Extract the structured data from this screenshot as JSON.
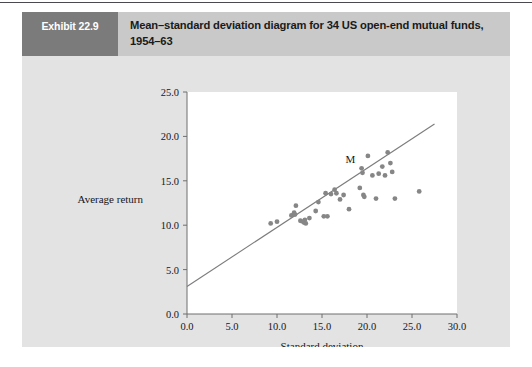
{
  "exhibit": {
    "tag": "Exhibit 22.9",
    "title": "Mean–standard deviation diagram for 34 US open-end mutual funds, 1954–63"
  },
  "colors": {
    "card_background": "#e3e3e3",
    "header_background": "#c9c9c9",
    "tag_background": "#7b7b7b",
    "plot_background": "#ffffff",
    "point": "#868686",
    "line": "#7c7c7c",
    "axis": "#6f6f6f"
  },
  "chart_data": {
    "type": "scatter",
    "title": "Mean–standard deviation diagram for 34 US open-end mutual funds, 1954–63",
    "xlabel": "Standard deviation",
    "ylabel": "Average return",
    "xlim": [
      0.0,
      30.0
    ],
    "ylim": [
      0.0,
      25.0
    ],
    "xticks": [
      "0.0",
      "5.0",
      "10.0",
      "15.0",
      "20.0",
      "25.0",
      "30.0"
    ],
    "yticks": [
      "0.0",
      "5.0",
      "10.0",
      "15.0",
      "20.0",
      "25.0"
    ],
    "xtick_values": [
      0,
      5,
      10,
      15,
      20,
      25,
      30
    ],
    "ytick_values": [
      0,
      5,
      10,
      15,
      20,
      25
    ],
    "grid": false,
    "legend": "none",
    "series": [
      {
        "name": "US open-end mutual funds",
        "marker": "filled-circle",
        "points": [
          [
            9.3,
            10.2
          ],
          [
            10.0,
            10.4
          ],
          [
            11.6,
            11.1
          ],
          [
            11.9,
            11.4
          ],
          [
            12.0,
            11.2
          ],
          [
            12.1,
            12.2
          ],
          [
            12.6,
            10.5
          ],
          [
            12.9,
            10.4
          ],
          [
            13.0,
            10.3
          ],
          [
            13.1,
            10.6
          ],
          [
            13.2,
            10.2
          ],
          [
            13.6,
            10.8
          ],
          [
            14.3,
            11.6
          ],
          [
            14.6,
            12.6
          ],
          [
            15.2,
            11.0
          ],
          [
            15.6,
            11.0
          ],
          [
            15.4,
            13.6
          ],
          [
            16.0,
            13.5
          ],
          [
            16.4,
            14.0
          ],
          [
            16.6,
            13.6
          ],
          [
            17.0,
            12.9
          ],
          [
            17.4,
            13.4
          ],
          [
            18.0,
            11.8
          ],
          [
            19.2,
            14.2
          ],
          [
            19.4,
            16.4
          ],
          [
            19.5,
            15.9
          ],
          [
            19.6,
            13.4
          ],
          [
            19.7,
            13.2
          ],
          [
            20.1,
            17.8
          ],
          [
            20.6,
            15.6
          ],
          [
            21.0,
            13.0
          ],
          [
            21.3,
            15.8
          ],
          [
            21.7,
            16.6
          ],
          [
            22.0,
            15.6
          ],
          [
            22.3,
            18.2
          ],
          [
            22.6,
            17.0
          ],
          [
            22.8,
            16.0
          ],
          [
            23.1,
            13.0
          ],
          [
            25.8,
            13.8
          ]
        ]
      }
    ],
    "annotations": [
      {
        "label": "M",
        "x": 19.5,
        "y": 16.0,
        "description": "market portfolio point on the regression line"
      }
    ],
    "fit_line": {
      "name": "regression line",
      "x_start": 0.0,
      "y_start": 3.1,
      "x_end": 27.5,
      "y_end": 21.4,
      "slope": 0.665,
      "intercept": 3.1
    }
  }
}
